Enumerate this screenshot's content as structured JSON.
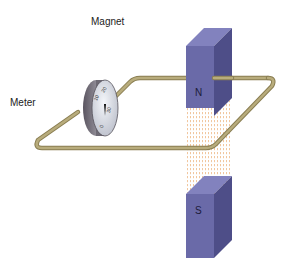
{
  "labels": {
    "magnet": "Magnet",
    "meter": "Meter"
  },
  "magnet": {
    "north_pole": "N",
    "south_pole": "S",
    "color_front": "#6a6aa8",
    "color_side": "#4e4e88",
    "color_top": "#8080bc"
  },
  "meter": {
    "scale_labels": [
      "10",
      "20",
      "30",
      "0"
    ]
  },
  "wire": {
    "color": "#a89a6a"
  },
  "field_lines": {
    "color": "#e8a060"
  }
}
